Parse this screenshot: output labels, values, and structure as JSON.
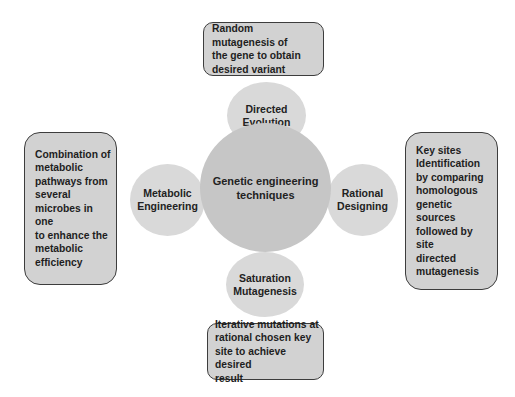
{
  "diagram": {
    "center": {
      "label": "Genetic engineering\ntechniques"
    },
    "techniques": [
      {
        "id": "directed-evolution",
        "label": "Directed\nEvolution",
        "position": "top",
        "description": "Random mutagenesis of\nthe gene to obtain\ndesired variant"
      },
      {
        "id": "rational-designing",
        "label": "Rational\nDesigning",
        "position": "right",
        "description": "Key sites\nIdentification\nby comparing\nhomologous\ngenetic sources\nfollowed by site\ndirected\nmutagenesis"
      },
      {
        "id": "saturation-mutagenesis",
        "label": "Saturation\nMutagenesis",
        "position": "bottom",
        "description": "Iterative mutations at\nrational chosen key\nsite to achieve desired\nresult"
      },
      {
        "id": "metabolic-engineering",
        "label": "Metabolic\nEngineering",
        "position": "left",
        "description": "Combination of\nmetabolic\npathways from\nseveral\nmicrobes in one\nto enhance the\nmetabolic\nefficiency"
      }
    ]
  },
  "colors": {
    "center_fill": "#c6c6c6",
    "outer_fill": "#d9d9d9",
    "box_fill": "#d2d2d2",
    "box_border": "#3d3d3d",
    "background": "#ffffff"
  }
}
